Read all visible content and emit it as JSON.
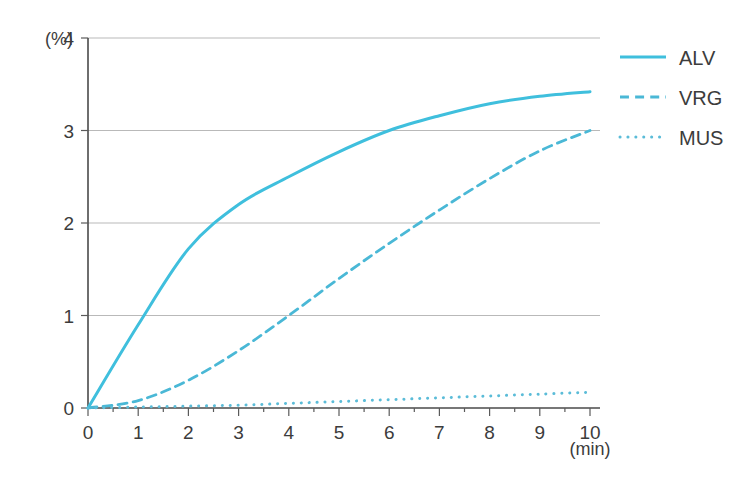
{
  "chart_data": {
    "type": "line",
    "title": "",
    "subtitle": "",
    "xlabel": "(min)",
    "ylabel": "(%)",
    "xlim": [
      0,
      10
    ],
    "ylim": [
      0,
      4
    ],
    "grid": true,
    "grid_axis": "y",
    "legend_position": "top-right",
    "x_ticks": [
      "0",
      "1",
      "2",
      "3",
      "4",
      "5",
      "6",
      "7",
      "8",
      "9",
      "10"
    ],
    "y_ticks": [
      "0",
      "1",
      "2",
      "3",
      "4"
    ],
    "x": [
      0,
      1,
      2,
      3,
      4,
      5,
      6,
      7,
      8,
      9,
      10
    ],
    "series": [
      {
        "name": "ALV",
        "style": "solid",
        "color": "#3fbfdd",
        "values": [
          0,
          0.9,
          1.72,
          2.2,
          2.5,
          2.77,
          3.0,
          3.16,
          3.29,
          3.37,
          3.42
        ]
      },
      {
        "name": "VRG",
        "style": "dashed",
        "color": "#4ab8d6",
        "values": [
          0,
          0.08,
          0.3,
          0.62,
          1.0,
          1.4,
          1.78,
          2.14,
          2.48,
          2.78,
          3.0
        ]
      },
      {
        "name": "MUS",
        "style": "dotted",
        "color": "#5bbcd8",
        "values": [
          0,
          0.01,
          0.02,
          0.03,
          0.05,
          0.07,
          0.09,
          0.11,
          0.13,
          0.15,
          0.17
        ]
      }
    ]
  },
  "legend": {
    "items": [
      {
        "label": "ALV",
        "style": "solid"
      },
      {
        "label": "VRG",
        "style": "dashed"
      },
      {
        "label": "MUS",
        "style": "dotted"
      }
    ]
  },
  "axes": {
    "y_unit": "(%)",
    "x_unit": "(min)"
  },
  "colors": {
    "accent": "#3fbfdd",
    "axis": "#4a4a4a",
    "grid": "#b9b9b9",
    "text": "#3c3c3c",
    "background": "#ffffff"
  }
}
